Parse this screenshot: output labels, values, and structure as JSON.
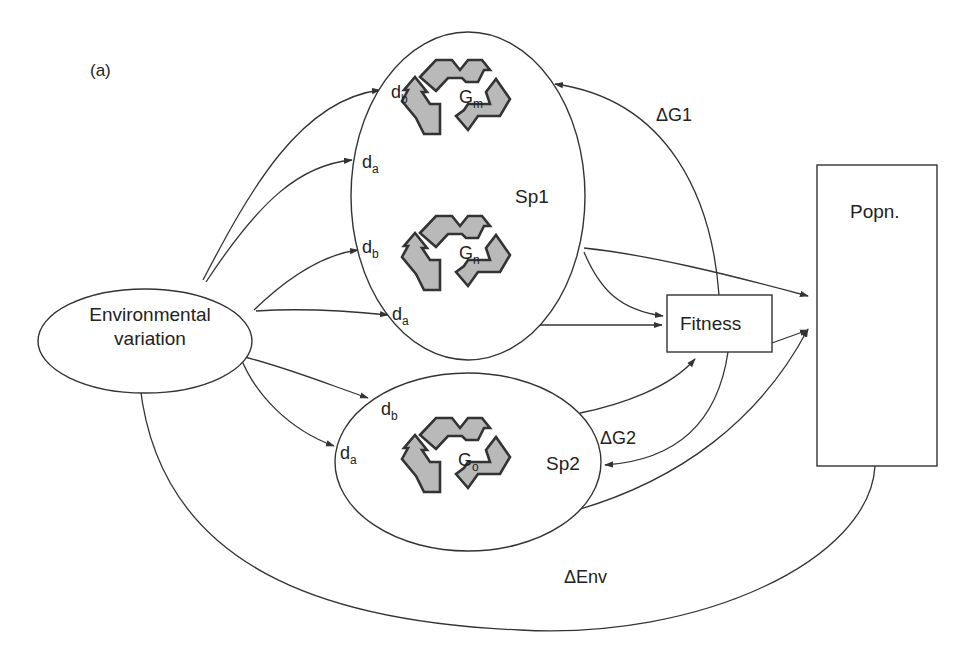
{
  "figure": {
    "panel_label": "(a)",
    "background": "#ffffff",
    "stroke_color": "#333333",
    "icon_fill": "#b9b9b9"
  },
  "nodes": {
    "environment": {
      "line1": "Environmental",
      "line2": "variation"
    },
    "species1": {
      "label": "Sp1",
      "genes": [
        {
          "base": "G",
          "sub": "m",
          "icon": "recycle-icon"
        },
        {
          "base": "G",
          "sub": "n",
          "icon": "recycle-icon"
        }
      ],
      "inputs": [
        {
          "base": "d",
          "sub": "b"
        },
        {
          "base": "d",
          "sub": "a"
        },
        {
          "base": "d",
          "sub": "b"
        },
        {
          "base": "d",
          "sub": "a"
        }
      ]
    },
    "species2": {
      "label": "Sp2",
      "genes": [
        {
          "base": "G",
          "sub": "o",
          "icon": "recycle-icon"
        }
      ],
      "inputs": [
        {
          "base": "d",
          "sub": "b"
        },
        {
          "base": "d",
          "sub": "a"
        }
      ]
    },
    "fitness": {
      "label": "Fitness"
    },
    "population": {
      "label": "Popn."
    }
  },
  "edges": {
    "delta_g1": "ΔG1",
    "delta_g2": "ΔG2",
    "delta_env": "ΔEnv"
  }
}
